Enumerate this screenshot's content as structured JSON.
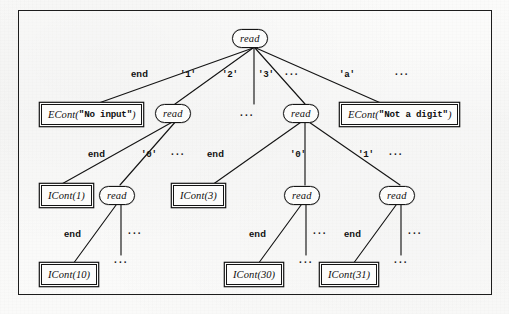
{
  "figure": {
    "kind": "computation-tree"
  },
  "nodes": {
    "root": {
      "label": "read",
      "shape": "rounded"
    },
    "r_l1": {
      "label": "read",
      "shape": "rounded"
    },
    "r_l3": {
      "label": "read",
      "shape": "rounded"
    },
    "r_l1_0": {
      "label": "read",
      "shape": "rounded"
    },
    "r_l3_0": {
      "label": "read",
      "shape": "rounded"
    },
    "r_l3_1": {
      "label": "read",
      "shape": "rounded"
    },
    "econt_no_input": {
      "name": "ECont",
      "arg": "\"No input\"",
      "arg_kind": "string",
      "shape": "box"
    },
    "econt_not_digit": {
      "name": "ECont",
      "arg": "\"Not a digit\"",
      "arg_kind": "string",
      "shape": "box"
    },
    "icont_1": {
      "name": "ICont",
      "arg": "1",
      "arg_kind": "number",
      "shape": "box"
    },
    "icont_3": {
      "name": "ICont",
      "arg": "3",
      "arg_kind": "number",
      "shape": "box"
    },
    "icont_10": {
      "name": "ICont",
      "arg": "10",
      "arg_kind": "number",
      "shape": "box"
    },
    "icont_30": {
      "name": "ICont",
      "arg": "30",
      "arg_kind": "number",
      "shape": "box"
    },
    "icont_31": {
      "name": "ICont",
      "arg": "31",
      "arg_kind": "number",
      "shape": "box"
    }
  },
  "edge_labels": {
    "root_end": "end",
    "root_1": "'1'",
    "root_2": "'2'",
    "root_3": "'3'",
    "root_3_dots": "···",
    "root_a": "'a'",
    "root_tail_dots": "···",
    "l1_end": "end",
    "l1_0": "'0'",
    "l1_dots": "···",
    "l3_end": "end",
    "l3_0": "'0'",
    "l3_1": "'1'",
    "l3_dots": "···",
    "l1_0_end": "end",
    "l1_0_dots": "···",
    "l3_0_end": "end",
    "l3_0_dots": "···",
    "l3_1_end": "end",
    "l3_1_dots": "···"
  },
  "placeholders": {
    "branch_2": "···",
    "below_icont_1": "···",
    "below_icont_10": "···",
    "below_icont_30": "···",
    "below_icont_31": "···"
  },
  "colors": {
    "ink": "#131313",
    "paper": "#fbfbfa"
  }
}
